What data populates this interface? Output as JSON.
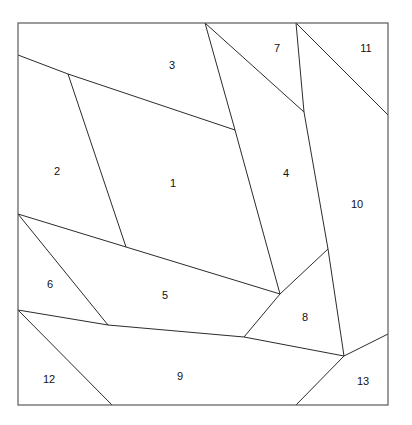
{
  "figure": {
    "title": "",
    "type": "planar-partition-diagram",
    "background_color": "#ffffff",
    "line_color": "#2b2b2b",
    "frame_color": "#5a5a5a",
    "label_color": "#111111",
    "frame": {
      "x": 18,
      "y": 23,
      "width": 370,
      "height": 382
    }
  },
  "regions": [
    {
      "id": 1,
      "label": "1",
      "label_x": 173,
      "label_y": 184,
      "points": "68,74 126,247 280,294 235,130 205,23 228,23"
    },
    {
      "id": 2,
      "label": "2",
      "label_x": 57,
      "label_y": 172,
      "points": "18,55 68,74 126,247 18,214"
    },
    {
      "id": 3,
      "label": "3",
      "label_x": 172,
      "label_y": 66,
      "points": "18,23 205,23 235,130 68,74 18,55"
    },
    {
      "id": 4,
      "label": "4",
      "label_x": 286,
      "label_y": 174,
      "points": "205,23 304,112 328,249 280,294 235,130"
    },
    {
      "id": 5,
      "label": "5",
      "label_x": 165,
      "label_y": 296,
      "points": "18,214 280,294 244,337 108,325"
    },
    {
      "id": 6,
      "label": "6",
      "label_x": 50,
      "label_y": 285,
      "points": "18,214 108,325 18,310"
    },
    {
      "id": 7,
      "label": "7",
      "label_x": 277,
      "label_y": 49,
      "points": "205,23 296,23 304,112"
    },
    {
      "id": 8,
      "label": "8",
      "label_x": 305,
      "label_y": 318,
      "points": "280,294 328,249 344,356 244,337"
    },
    {
      "id": 9,
      "label": "9",
      "label_x": 180,
      "label_y": 377,
      "points": "18,310 108,325 244,337 344,356 296,405 112,405"
    },
    {
      "id": 10,
      "label": "10",
      "label_x": 357,
      "label_y": 205,
      "points": "296,23 388,115 388,334 344,356 328,249 304,112"
    },
    {
      "id": 11,
      "label": "11",
      "label_x": 366,
      "label_y": 49,
      "points": "296,23 388,23 388,115"
    },
    {
      "id": 12,
      "label": "12",
      "label_x": 49,
      "label_y": 380,
      "points": "18,310 112,405 18,405"
    },
    {
      "id": 13,
      "label": "13",
      "label_x": 363,
      "label_y": 382,
      "points": "344,356 388,334 388,405 296,405"
    }
  ],
  "edges": [
    {
      "name": "edge-top-left-diagonal",
      "d": "M 18,55 L 68,74"
    },
    {
      "name": "edge-3-1-boundary",
      "d": "M 68,74 L 235,130"
    },
    {
      "name": "edge-2-1-boundary",
      "d": "M 68,74 L 126,247"
    },
    {
      "name": "edge-5-top-left",
      "d": "M 18,214 L 126,247"
    },
    {
      "name": "edge-5-top-right",
      "d": "M 126,247 L 280,294"
    },
    {
      "name": "edge-6-diagonal",
      "d": "M 18,214 L 108,325"
    },
    {
      "name": "edge-9-top-left",
      "d": "M 18,310 L 108,325"
    },
    {
      "name": "edge-9-top-mid",
      "d": "M 108,325 L 244,337"
    },
    {
      "name": "edge-9-top-right",
      "d": "M 244,337 L 344,356"
    },
    {
      "name": "edge-12-diagonal",
      "d": "M 18,310 L 112,405"
    },
    {
      "name": "edge-1-4-boundary",
      "d": "M 205,23 L 235,130 L 280,294"
    },
    {
      "name": "edge-7-4-boundary",
      "d": "M 205,23 L 304,112"
    },
    {
      "name": "edge-7-10-boundary",
      "d": "M 296,23 L 304,112 L 328,249 L 344,356"
    },
    {
      "name": "edge-11-10-boundary",
      "d": "M 296,23 L 388,115"
    },
    {
      "name": "edge-8-upper-left",
      "d": "M 280,294 L 328,249"
    },
    {
      "name": "edge-8-lower-left",
      "d": "M 280,294 L 244,337"
    },
    {
      "name": "edge-13-top",
      "d": "M 388,334 L 344,356"
    },
    {
      "name": "edge-13-left",
      "d": "M 344,356 L 296,405"
    }
  ],
  "legend": {
    "region_count": 13,
    "region_ids": [
      1,
      2,
      3,
      4,
      5,
      6,
      7,
      8,
      9,
      10,
      11,
      12,
      13
    ]
  }
}
